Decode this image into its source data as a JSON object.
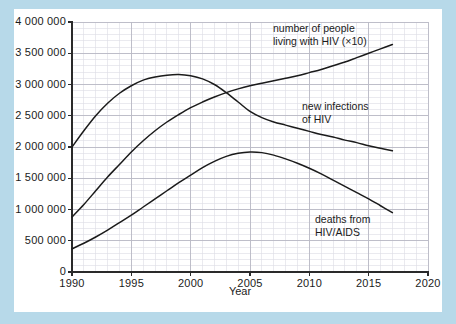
{
  "figure": {
    "background_color": "#b7d9e9",
    "card_color": "#ffffff",
    "line_color": "#1b1b1b",
    "grid_major_color": "#b9b9c4",
    "grid_minor_color": "#dcdce4"
  },
  "chart_data": {
    "type": "line",
    "title": "",
    "subtitle": "",
    "xlabel": "Year",
    "ylabel": "",
    "grid": true,
    "legend_position": "inline-annotations",
    "xlim": [
      1990,
      2020
    ],
    "ylim": [
      0,
      4000000
    ],
    "x_ticks": [
      1990,
      1995,
      2000,
      2005,
      2010,
      2015,
      2020
    ],
    "x_tick_labels": [
      "1990",
      "1995",
      "2000",
      "2005",
      "2010",
      "2015",
      "2020"
    ],
    "x_minor_step": 1,
    "y_ticks": [
      0,
      500000,
      1000000,
      1500000,
      2000000,
      2500000,
      3000000,
      3500000,
      4000000
    ],
    "y_tick_labels": [
      "0",
      "500 000",
      "1 000 000",
      "1 500 000",
      "2 000 000",
      "2 500 000",
      "3 000 000",
      "3 500 000",
      "4 000 000"
    ],
    "y_minor_step": 100000,
    "series": [
      {
        "name": "number of people living with HIV (×10)",
        "label_lines": [
          "number of people",
          "living with HIV (×10)"
        ],
        "x": [
          1990,
          1991,
          1992,
          1993,
          1994,
          1995,
          1996,
          1997,
          1998,
          1999,
          2000,
          2001,
          2002,
          2003,
          2004,
          2005,
          2006,
          2007,
          2008,
          2009,
          2010,
          2011,
          2012,
          2013,
          2014,
          2015,
          2016,
          2017
        ],
        "values": [
          880000,
          1080000,
          1300000,
          1520000,
          1720000,
          1920000,
          2100000,
          2260000,
          2400000,
          2520000,
          2630000,
          2720000,
          2800000,
          2870000,
          2930000,
          2980000,
          3020000,
          3060000,
          3100000,
          3140000,
          3190000,
          3240000,
          3300000,
          3360000,
          3430000,
          3500000,
          3570000,
          3640000
        ]
      },
      {
        "name": "new infections of HIV",
        "label_lines": [
          "new infections",
          "of HIV"
        ],
        "x": [
          1990,
          1991,
          1992,
          1993,
          1994,
          1995,
          1996,
          1997,
          1998,
          1999,
          2000,
          2001,
          2002,
          2003,
          2004,
          2005,
          2006,
          2007,
          2008,
          2009,
          2010,
          2011,
          2012,
          2013,
          2014,
          2015,
          2016,
          2017
        ],
        "values": [
          2000000,
          2260000,
          2500000,
          2700000,
          2860000,
          2980000,
          3070000,
          3120000,
          3150000,
          3160000,
          3140000,
          3090000,
          3000000,
          2870000,
          2720000,
          2570000,
          2470000,
          2400000,
          2350000,
          2300000,
          2250000,
          2200000,
          2160000,
          2110000,
          2070000,
          2020000,
          1980000,
          1940000
        ]
      },
      {
        "name": "deaths from HIV/AIDS",
        "label_lines": [
          "deaths from",
          "HIV/AIDS"
        ],
        "x": [
          1990,
          1991,
          1992,
          1993,
          1994,
          1995,
          1996,
          1997,
          1998,
          1999,
          2000,
          2001,
          2002,
          2003,
          2004,
          2005,
          2006,
          2007,
          2008,
          2009,
          2010,
          2011,
          2012,
          2013,
          2014,
          2015,
          2016,
          2017
        ],
        "values": [
          370000,
          460000,
          560000,
          670000,
          790000,
          910000,
          1040000,
          1170000,
          1300000,
          1430000,
          1550000,
          1670000,
          1770000,
          1850000,
          1900000,
          1920000,
          1910000,
          1870000,
          1810000,
          1740000,
          1660000,
          1570000,
          1470000,
          1370000,
          1270000,
          1170000,
          1060000,
          950000
        ]
      }
    ],
    "annotations": [
      {
        "name": "people-living-with-hiv-label",
        "lines": [
          "number of people",
          "living with HIV (×10)"
        ],
        "x_px": 273,
        "y_px": 22
      },
      {
        "name": "new-infections-label",
        "lines": [
          "new infections",
          "of HIV"
        ],
        "x_px": 302,
        "y_px": 100
      },
      {
        "name": "deaths-label",
        "lines": [
          "deaths from",
          "HIV/AIDS"
        ],
        "x_px": 315,
        "y_px": 213
      }
    ]
  }
}
